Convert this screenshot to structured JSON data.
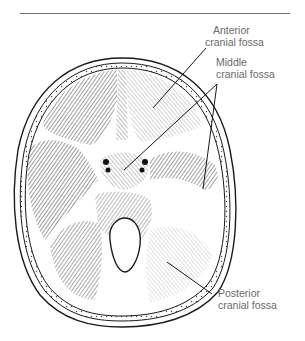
{
  "figure": {
    "type": "anatomical illustration",
    "labels": [
      {
        "line1": "Anterior",
        "line2": "cranial fossa"
      },
      {
        "line1": "Middle",
        "line2": "cranial fossa"
      },
      {
        "line1": "Posterior",
        "line2": "cranial fossa"
      }
    ]
  },
  "caption": {
    "text": ""
  },
  "colors": {
    "ink": "#1a1a1a",
    "label_text": "#6a6a6a",
    "rule": "#6f6f6f",
    "background": "#ffffff"
  }
}
